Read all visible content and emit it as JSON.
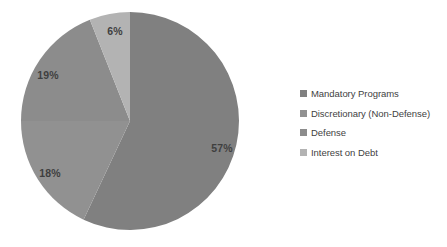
{
  "chart_data": {
    "type": "pie",
    "title": "",
    "subtitle": "",
    "xlabel": "",
    "ylabel": "",
    "grid": false,
    "legend_position": "right",
    "background_color": "#ffffff",
    "label_text_color": "#3f3f3f",
    "start_angle_deg": 0,
    "direction": "clockwise",
    "categories": [
      "Mandatory Programs",
      "Discretionary (Non-Defense)",
      "Defense",
      "Interest on Debt"
    ],
    "values": [
      57,
      18,
      19,
      6
    ],
    "value_labels": [
      "57%",
      "18%",
      "19%",
      "6%"
    ],
    "colors": [
      "#808080",
      "#919191",
      "#8c8c8c",
      "#b3b3b3"
    ],
    "slices": [
      {
        "name": "Mandatory Programs",
        "value": 57,
        "label": "57%",
        "color": "#808080",
        "label_x": 222,
        "label_y": 148
      },
      {
        "name": "Discretionary (Non-Defense)",
        "value": 18,
        "label": "18%",
        "color": "#919191",
        "label_x": 50,
        "label_y": 173
      },
      {
        "name": "Defense",
        "value": 19,
        "label": "19%",
        "color": "#8c8c8c",
        "label_x": 48,
        "label_y": 75
      },
      {
        "name": "Interest on Debt",
        "value": 6,
        "label": "6%",
        "color": "#b3b3b3",
        "label_x": 115,
        "label_y": 31
      }
    ],
    "geometry": {
      "center_x": 130,
      "center_y": 121,
      "radius": 109
    }
  },
  "legend": {
    "items": [
      {
        "label": "Mandatory Programs",
        "color": "#808080"
      },
      {
        "label": "Discretionary (Non-Defense)",
        "color": "#919191"
      },
      {
        "label": "Defense",
        "color": "#8c8c8c"
      },
      {
        "label": "Interest on Debt",
        "color": "#b3b3b3"
      }
    ]
  }
}
